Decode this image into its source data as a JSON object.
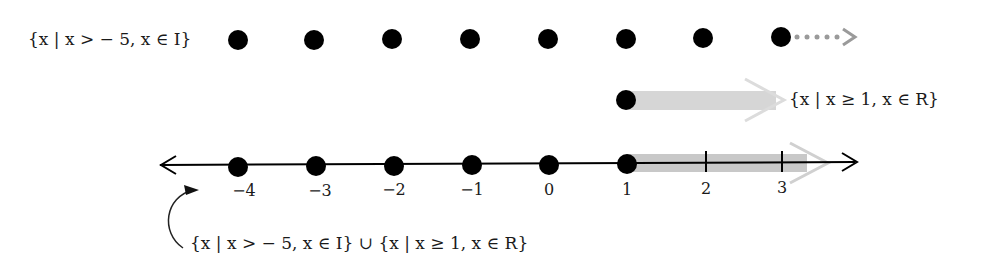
{
  "diagram": {
    "set_integers": {
      "label": "{x | x > − 5, x ∈ I}",
      "dot_positions": [
        238,
        314,
        392,
        470,
        548,
        626,
        703,
        781
      ],
      "y": 40,
      "continuation": "dotted-arrow-right"
    },
    "set_reals": {
      "label": "{x | x ≥ 1, x ∈ R}",
      "start_x": 626,
      "y": 100,
      "arrow_color": "#d9d9d9"
    },
    "number_line": {
      "y": 163,
      "ticks": [
        {
          "value": "−4",
          "x": 238,
          "dot": true
        },
        {
          "value": "−3",
          "x": 316,
          "dot": true
        },
        {
          "value": "−2",
          "x": 394,
          "dot": true
        },
        {
          "value": "−1",
          "x": 472,
          "dot": true
        },
        {
          "value": "0",
          "x": 549,
          "dot": true
        },
        {
          "value": "1",
          "x": 627,
          "dot": true
        },
        {
          "value": "2",
          "x": 706,
          "dot": false
        },
        {
          "value": "3",
          "x": 782,
          "dot": false
        }
      ],
      "shaded_from": 627,
      "shade_color": "#c8c8c8"
    },
    "union_label": "{x | x > − 5, x ∈ I}  ∪  {x | x ≥ 1, x ∈ R}"
  }
}
